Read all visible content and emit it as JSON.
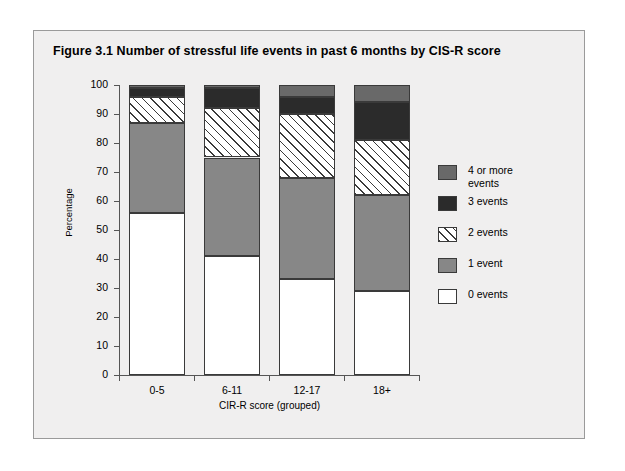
{
  "figure": {
    "title": "Figure 3.1   Number of stressful life events in past 6 months by CIS-R score"
  },
  "axes": {
    "y_title": "Percentage",
    "x_title": "CIR-R score (grouped)",
    "y_ticks": [
      "0",
      "10",
      "20",
      "30",
      "40",
      "50",
      "60",
      "70",
      "80",
      "90",
      "100"
    ],
    "x_ticks": [
      "0-5",
      "6-11",
      "12-17",
      "18+"
    ]
  },
  "legend": {
    "items": [
      {
        "label": "4 or more events",
        "fill": "darkgray",
        "color": "#696969"
      },
      {
        "label": "3 events",
        "fill": "black",
        "color": "#2b2b2b"
      },
      {
        "label": "2 events",
        "fill": "hatch",
        "color": "#ffffff"
      },
      {
        "label": "1 event",
        "fill": "gray",
        "color": "#878787"
      },
      {
        "label": "0 events",
        "fill": "none",
        "color": "#ffffff"
      }
    ]
  },
  "colors": {
    "card_background": "#f0efef",
    "card_border": "#9a9a9a",
    "axis": "#555555",
    "bar_outline": "#3a3a3a"
  },
  "chart_data": {
    "type": "bar",
    "stacked": true,
    "title": "Figure 3.1   Number of stressful life events in past 6 months by CIS-R score",
    "xlabel": "CIR-R score (grouped)",
    "ylabel": "Percentage",
    "ylim": [
      0,
      100
    ],
    "ytick_step": 10,
    "grid": false,
    "legend_position": "right",
    "categories": [
      "0-5",
      "6-11",
      "12-17",
      "18+"
    ],
    "series": [
      {
        "name": "0 events",
        "values": [
          56,
          41,
          33,
          29
        ]
      },
      {
        "name": "1 event",
        "values": [
          31,
          34,
          35,
          33
        ]
      },
      {
        "name": "2 events",
        "values": [
          9,
          17,
          22,
          19
        ]
      },
      {
        "name": "3 events",
        "values": [
          3,
          7,
          6,
          13
        ]
      },
      {
        "name": "4 or more events",
        "values": [
          1,
          1,
          4,
          6
        ]
      }
    ],
    "cumulative_tops": [
      [
        56,
        87,
        96,
        99,
        100
      ],
      [
        41,
        75,
        92,
        99,
        100
      ],
      [
        33,
        68,
        90,
        96,
        100
      ],
      [
        29,
        62,
        81,
        94,
        100
      ]
    ]
  }
}
